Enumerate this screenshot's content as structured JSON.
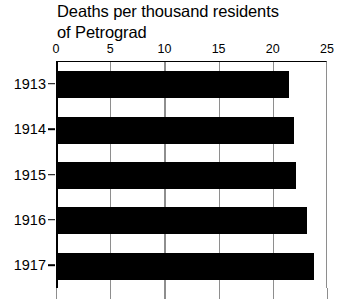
{
  "chart_data": {
    "type": "bar",
    "orientation": "horizontal",
    "title": "Deaths per thousand residents\nof Petrograd",
    "title_line1": "Deaths per thousand residents",
    "title_line2": "of Petrograd",
    "xlabel": "",
    "ylabel": "",
    "categories": [
      "1913",
      "1914",
      "1915",
      "1916",
      "1917"
    ],
    "values": [
      21.5,
      22.0,
      22.1,
      23.2,
      23.8
    ],
    "series": [
      {
        "name": "Deaths per thousand residents",
        "values": [
          21.5,
          22.0,
          22.1,
          23.2,
          23.8
        ]
      }
    ],
    "xlim": [
      0,
      25
    ],
    "ylim": null,
    "x_ticks": [
      0,
      5,
      10,
      15,
      20,
      25
    ],
    "x_tick_labels": [
      "0",
      "5",
      "10",
      "15",
      "20",
      "25"
    ],
    "y_tick_labels": [
      "1913",
      "1914",
      "1915",
      "1916",
      "1917"
    ],
    "grid": true,
    "grid_axis": "x",
    "legend": false,
    "legend_position": "none",
    "axis_position": "top",
    "bar_color": "#000000",
    "grid_color": "#8e8e8e",
    "axis_color": "#000000",
    "background_color": "#ffffff"
  }
}
